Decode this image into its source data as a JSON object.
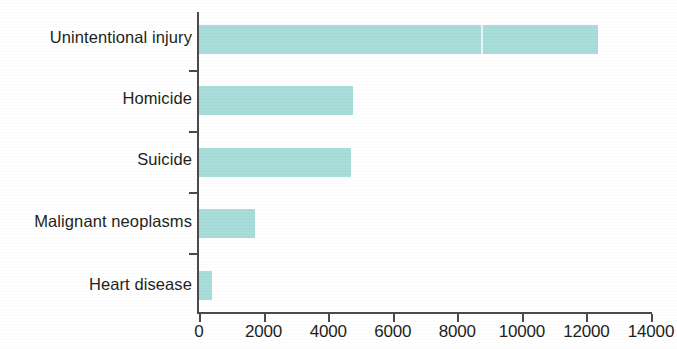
{
  "chart_data": {
    "type": "bar",
    "orientation": "horizontal",
    "title": "",
    "subtitle": "",
    "xlabel": "",
    "ylabel": "",
    "categories": [
      "Unintentional injury",
      "Homicide",
      "Suicide",
      "Malignant neoplasms",
      "Heart disease"
    ],
    "values": [
      12350,
      4770,
      4700,
      1730,
      400
    ],
    "xlim": [
      0,
      14000
    ],
    "xticks": [
      0,
      2000,
      4000,
      6000,
      8000,
      10000,
      12000,
      14000
    ],
    "xtick_labels": [
      "0",
      "2000",
      "4000",
      "6000",
      "8000",
      "10000",
      "12000",
      "14000"
    ],
    "grid": false,
    "legend": null,
    "bar_color": "#a8ddd9",
    "axis_color": "#4a4a4a",
    "background_color": "#ffffff",
    "annotations": []
  },
  "axis": {
    "x_min_label": "0",
    "x_max_label": "14000"
  }
}
